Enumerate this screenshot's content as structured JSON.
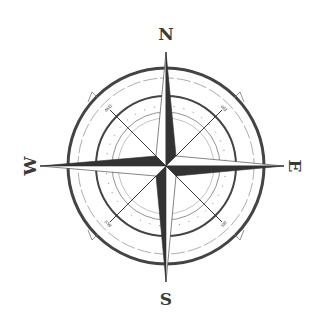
{
  "compass": {
    "cardinal": {
      "n": "N",
      "e": "E",
      "s": "S",
      "w": "W"
    },
    "intercardinal": {
      "nw": "nw",
      "ne": "ne",
      "se": "se",
      "sw": "sw"
    },
    "colors": {
      "dark": "#333333",
      "light": "#ffffff",
      "ring": "#444444",
      "thin": "#888888"
    }
  }
}
